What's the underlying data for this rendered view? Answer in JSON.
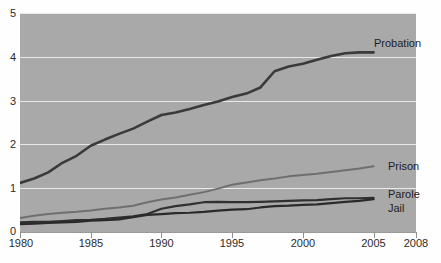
{
  "chart_data": {
    "type": "line",
    "title": "",
    "xlabel": "",
    "ylabel": "",
    "xlim": [
      1980,
      2008
    ],
    "ylim": [
      0,
      5
    ],
    "grid": true,
    "legend_position": "right-inline-at-line-end",
    "y_ticks": [
      "0",
      "1",
      "2",
      "3",
      "4",
      "5"
    ],
    "y_tick_values": [
      0,
      1,
      2,
      3,
      4,
      5
    ],
    "x_ticks": [
      "1980",
      "1985",
      "1990",
      "1995",
      "2000",
      "2005",
      "2008"
    ],
    "x_tick_values": [
      1980,
      1985,
      1990,
      1995,
      2000,
      2005,
      2008
    ],
    "x": [
      1980,
      1981,
      1982,
      1983,
      1984,
      1985,
      1986,
      1987,
      1988,
      1989,
      1990,
      1991,
      1992,
      1993,
      1994,
      1995,
      1996,
      1997,
      1998,
      1999,
      2000,
      2001,
      2002,
      2003,
      2004,
      2005
    ],
    "series": [
      {
        "name": "Probation",
        "color": "#3a3a3a",
        "width": 2.6,
        "values": [
          1.12,
          1.22,
          1.36,
          1.58,
          1.74,
          1.97,
          2.11,
          2.24,
          2.36,
          2.52,
          2.67,
          2.73,
          2.81,
          2.9,
          2.98,
          3.08,
          3.16,
          3.3,
          3.67,
          3.78,
          3.84,
          3.93,
          4.02,
          4.08,
          4.1,
          4.1
        ],
        "label_value": "4.1"
      },
      {
        "name": "Prison",
        "color": "#6f6f6f",
        "width": 2.0,
        "values": [
          0.32,
          0.37,
          0.41,
          0.44,
          0.46,
          0.49,
          0.53,
          0.56,
          0.6,
          0.68,
          0.74,
          0.79,
          0.85,
          0.91,
          0.99,
          1.08,
          1.13,
          1.18,
          1.22,
          1.27,
          1.3,
          1.33,
          1.37,
          1.41,
          1.45,
          1.5
        ],
        "label_value": "1.5"
      },
      {
        "name": "Parole",
        "color": "#303030",
        "width": 2.2,
        "values": [
          0.22,
          0.23,
          0.23,
          0.25,
          0.27,
          0.28,
          0.3,
          0.33,
          0.36,
          0.41,
          0.53,
          0.59,
          0.63,
          0.68,
          0.69,
          0.68,
          0.68,
          0.69,
          0.7,
          0.71,
          0.72,
          0.73,
          0.75,
          0.77,
          0.77,
          0.78
        ],
        "label_value": "0.78"
      },
      {
        "name": "Jail",
        "color": "#2a2a2a",
        "width": 2.2,
        "values": [
          0.18,
          0.19,
          0.21,
          0.22,
          0.23,
          0.26,
          0.27,
          0.29,
          0.34,
          0.39,
          0.41,
          0.43,
          0.44,
          0.46,
          0.49,
          0.51,
          0.52,
          0.56,
          0.59,
          0.6,
          0.62,
          0.63,
          0.66,
          0.69,
          0.71,
          0.75
        ],
        "label_value": "0.75"
      }
    ],
    "colors": {
      "panel_background": "#a9a9a9",
      "gridline": "#e9e9e9",
      "page_background": "#fefefe",
      "tick_text": "#2b2b2b"
    }
  },
  "axis": {
    "y_labels": [
      "5",
      "4",
      "3",
      "2",
      "1",
      "0"
    ],
    "x_labels": [
      "1980",
      "1985",
      "1990",
      "1995",
      "2000",
      "2005",
      "2008"
    ]
  },
  "series_labels": {
    "probation": "Probation",
    "prison": "Prison",
    "parole": "Parole",
    "jail": "Jail"
  }
}
